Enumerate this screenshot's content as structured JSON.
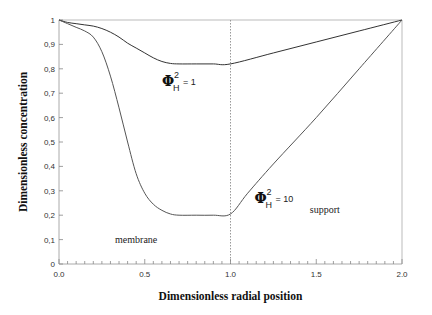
{
  "chart_data": {
    "type": "line",
    "title": "",
    "xlabel": "Dimensionless radial position",
    "ylabel": "Dimensionless concentration",
    "xlim": [
      0.0,
      2.0
    ],
    "ylim": [
      0,
      1
    ],
    "x_ticks": [
      "0.0",
      "0.5",
      "1.0",
      "1.5",
      "2.0"
    ],
    "x_tick_values": [
      0.0,
      0.5,
      1.0,
      1.5,
      2.0
    ],
    "y_ticks": [
      "0",
      "0,1",
      "0,2",
      "0,3",
      "0,4",
      "0,5",
      "0,6",
      "0,7",
      "0,8",
      "0,9",
      "1"
    ],
    "y_tick_values": [
      0,
      0.1,
      0.2,
      0.3,
      0.4,
      0.5,
      0.6,
      0.7,
      0.8,
      0.9,
      1.0
    ],
    "grid": false,
    "reference_line": {
      "x": 1.0,
      "style": "dotted"
    },
    "region_labels": [
      {
        "text": "membrane",
        "x": 0.45,
        "y": 0.085
      },
      {
        "text": "support",
        "x": 1.55,
        "y": 0.21
      }
    ],
    "series": [
      {
        "name": "Phi_H^2 = 1",
        "annotation": {
          "symbol": "Φ",
          "sub": "H",
          "sup": "2",
          "text": "= 1",
          "x": 0.6,
          "y": 0.73
        },
        "x": [
          0.0,
          0.05,
          0.1,
          0.15,
          0.2,
          0.25,
          0.3,
          0.35,
          0.4,
          0.45,
          0.5,
          0.55,
          0.6,
          0.65,
          0.7,
          0.8,
          0.9,
          1.0,
          1.25,
          1.5,
          1.75,
          2.0
        ],
        "y": [
          1.0,
          0.99,
          0.985,
          0.98,
          0.975,
          0.965,
          0.95,
          0.93,
          0.905,
          0.885,
          0.865,
          0.845,
          0.83,
          0.822,
          0.82,
          0.82,
          0.82,
          0.82,
          0.865,
          0.91,
          0.955,
          1.0
        ]
      },
      {
        "name": "Phi_H^2 = 10",
        "annotation": {
          "symbol": "Φ",
          "sub": "H",
          "sup": "2",
          "text": "= 10",
          "x": 1.14,
          "y": 0.25
        },
        "x": [
          0.0,
          0.05,
          0.1,
          0.15,
          0.2,
          0.25,
          0.3,
          0.35,
          0.4,
          0.45,
          0.5,
          0.55,
          0.6,
          0.65,
          0.7,
          0.8,
          0.9,
          1.0,
          1.1,
          1.25,
          1.5,
          1.75,
          2.0
        ],
        "y": [
          1.0,
          0.985,
          0.97,
          0.955,
          0.93,
          0.87,
          0.77,
          0.64,
          0.5,
          0.37,
          0.29,
          0.245,
          0.22,
          0.205,
          0.2,
          0.2,
          0.2,
          0.205,
          0.29,
          0.41,
          0.6,
          0.8,
          1.0
        ]
      }
    ]
  }
}
